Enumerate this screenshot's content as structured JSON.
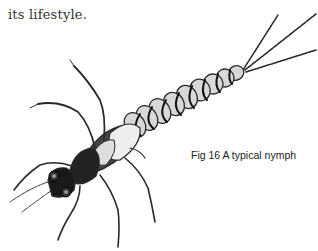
{
  "document": {
    "body_text": "its lifestyle.",
    "figure": {
      "caption": "Fig 16 A typical nymph",
      "subject": "mayfly-nymph-illustration"
    }
  }
}
